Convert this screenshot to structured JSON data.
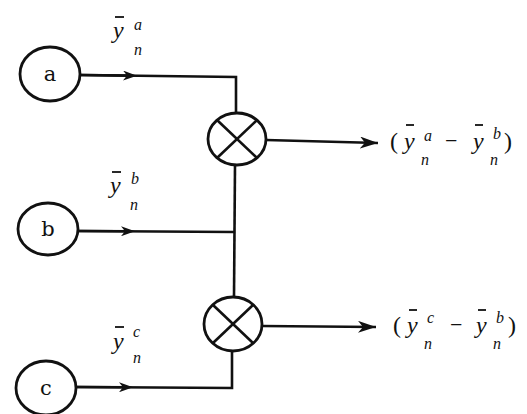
{
  "diagram": {
    "type": "signal-flow / differencing block diagram",
    "colors": {
      "stroke": "#111111",
      "background": "#ffffff"
    },
    "input_nodes": [
      {
        "id": "a",
        "label": "a"
      },
      {
        "id": "b",
        "label": "b"
      },
      {
        "id": "c",
        "label": "c"
      }
    ],
    "signals": [
      {
        "from": "a",
        "symbol": "y",
        "overbar": true,
        "superscript": "a",
        "subscript": "n"
      },
      {
        "from": "b",
        "symbol": "y",
        "overbar": true,
        "superscript": "b",
        "subscript": "n"
      },
      {
        "from": "c",
        "symbol": "y",
        "overbar": true,
        "superscript": "c",
        "subscript": "n"
      }
    ],
    "combiners": [
      {
        "id": "comparator-1",
        "icon": "circle-x-icon",
        "inputs": [
          "a",
          "b"
        ]
      },
      {
        "id": "comparator-2",
        "icon": "circle-x-icon",
        "inputs": [
          "c",
          "b"
        ]
      }
    ],
    "outputs": [
      {
        "from": "comparator-1",
        "open": "(",
        "term1": {
          "symbol": "y",
          "superscript": "a",
          "subscript": "n"
        },
        "operator": "−",
        "term2": {
          "symbol": "y",
          "superscript": "b",
          "subscript": "n"
        },
        "close": ")"
      },
      {
        "from": "comparator-2",
        "open": "(",
        "term1": {
          "symbol": "y",
          "superscript": "c",
          "subscript": "n"
        },
        "operator": "−",
        "term2": {
          "symbol": "y",
          "superscript": "b",
          "subscript": "n"
        },
        "close": ")"
      }
    ]
  }
}
